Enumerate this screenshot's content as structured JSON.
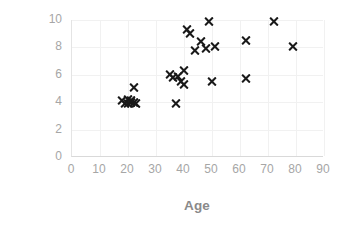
{
  "chart_data": {
    "type": "scatter",
    "title": "",
    "xlabel": "Age",
    "ylabel": "Preference",
    "xlim": [
      0,
      90
    ],
    "ylim": [
      0,
      10
    ],
    "xticks": [
      "0",
      "10",
      "20",
      "30",
      "40",
      "50",
      "60",
      "70",
      "80",
      "90"
    ],
    "yticks": [
      "0",
      "2",
      "4",
      "6",
      "8",
      "10"
    ],
    "grid": true,
    "legend": "none",
    "marker": "x",
    "marker_color": "#1a1a1a",
    "series": [
      {
        "name": "Preference vs Age",
        "points": [
          [
            18,
            4.1
          ],
          [
            19,
            3.9
          ],
          [
            20,
            4.2
          ],
          [
            20,
            3.9
          ],
          [
            21,
            4.0
          ],
          [
            21,
            4.1
          ],
          [
            22,
            4.0
          ],
          [
            22,
            5.1
          ],
          [
            23,
            3.9
          ],
          [
            35,
            6.0
          ],
          [
            36,
            5.8
          ],
          [
            37,
            3.9
          ],
          [
            38,
            5.9
          ],
          [
            39,
            5.5
          ],
          [
            40,
            6.3
          ],
          [
            40,
            5.3
          ],
          [
            41,
            9.3
          ],
          [
            42,
            9.0
          ],
          [
            44,
            7.8
          ],
          [
            46,
            8.4
          ],
          [
            48,
            7.9
          ],
          [
            49,
            9.9
          ],
          [
            51,
            8.1
          ],
          [
            50,
            5.5
          ],
          [
            62,
            8.5
          ],
          [
            62,
            5.7
          ],
          [
            72,
            9.9
          ],
          [
            79,
            8.1
          ]
        ]
      }
    ]
  },
  "axis": {
    "x_title": "Age",
    "y_title": "Preference"
  }
}
